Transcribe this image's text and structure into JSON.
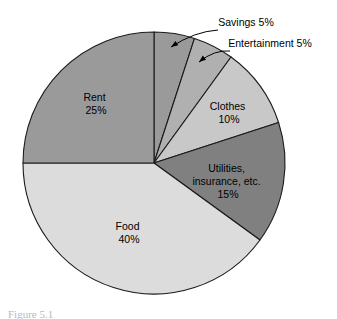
{
  "figure": {
    "background_color": "#ffffff",
    "outline_color": "#1a1a1a"
  },
  "caption": {
    "clipped_text": "Figure 5.1",
    "note": "caption cropped at bottom edge, illegible"
  },
  "chart_data": {
    "type": "pie",
    "title": "",
    "subtitle": "",
    "xlabel": "",
    "ylabel": "",
    "grid": false,
    "legend": "none",
    "units": "percent",
    "start_angle_deg": 0,
    "direction": "clockwise",
    "center": {
      "x": 154,
      "y": 163
    },
    "radius": 131,
    "categories": [
      "Savings",
      "Entertainment",
      "Clothes",
      "Utilities, insurance, etc.",
      "Food",
      "Rent"
    ],
    "values": [
      5,
      5,
      10,
      15,
      40,
      25
    ],
    "total": 100,
    "slices": [
      {
        "name": "Savings",
        "label_line1": "Savings 5%",
        "value": 5,
        "percent_text": "5%",
        "color": "#9a9a9a",
        "label_placement": "callout",
        "label_x": 246,
        "label_y": 26,
        "text_anchor": "middle"
      },
      {
        "name": "Entertainment",
        "label_line1": "Entertainment 5%",
        "value": 5,
        "percent_text": "5%",
        "color": "#b0b0b0",
        "label_placement": "callout",
        "label_x": 270,
        "label_y": 47,
        "text_anchor": "middle"
      },
      {
        "name": "Clothes",
        "label_line1": "Clothes",
        "label_line2": "10%",
        "value": 10,
        "percent_text": "10%",
        "color": "#c8c8c8",
        "label_placement": "inside",
        "label_x": 229,
        "label_y": 110,
        "text_anchor": "middle"
      },
      {
        "name": "Utilities",
        "label_line1": "Utilities,",
        "label_line2": "insurance, etc.",
        "label_line3": "15%",
        "value": 15,
        "percent_text": "15%",
        "color": "#808080",
        "label_placement": "inside",
        "label_x": 228,
        "label_y": 172,
        "text_anchor": "middle"
      },
      {
        "name": "Food",
        "label_line1": "Food",
        "label_line2": "40%",
        "value": 40,
        "percent_text": "40%",
        "color": "#dcdcdc",
        "label_placement": "inside",
        "label_x": 129,
        "label_y": 230,
        "text_anchor": "middle"
      },
      {
        "name": "Rent",
        "label_line1": "Rent",
        "label_line2": "25%",
        "value": 25,
        "percent_text": "25%",
        "color": "#9a9a9a",
        "label_placement": "inside",
        "label_x": 96,
        "label_y": 101,
        "text_anchor": "middle"
      }
    ],
    "callouts": [
      {
        "name": "savings-leader",
        "from_x": 218,
        "from_y": 30,
        "to_x": 171,
        "to_y": 47
      },
      {
        "name": "entertainment-leader",
        "from_x": 230,
        "from_y": 51,
        "to_x": 199,
        "to_y": 62
      }
    ]
  }
}
